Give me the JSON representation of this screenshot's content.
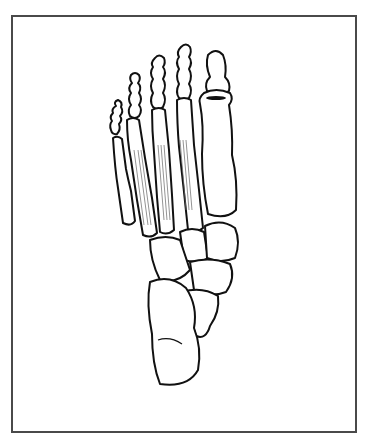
{
  "figure": {
    "style": "black line drawing",
    "frame_color": "#4a4a4a",
    "background": "#ffffff",
    "parts": {
      "toes": [
        "hallux",
        "second-toe",
        "third-toe",
        "fourth-toe",
        "fifth-toe"
      ],
      "metatarsals": 5,
      "tarsals": [
        "cuneiforms",
        "cuboid",
        "navicular",
        "talus",
        "calcaneus"
      ],
      "muscles": "dorsal-interossei"
    }
  }
}
